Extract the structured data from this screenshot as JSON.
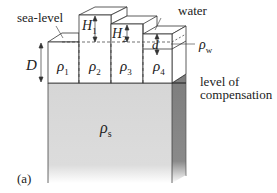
{
  "figure": {
    "panel_label": "(a)",
    "labels": {
      "sea_level": "sea-level",
      "water": "water",
      "rho_w": "ρ",
      "rho_w_sub": "w",
      "level_of_compensation_1": "level of",
      "level_of_compensation_2": "compensation",
      "D": "D",
      "H1": "H",
      "H1_sub": "1",
      "H2": "H",
      "H2_sub": "2",
      "d": "d",
      "rho1": "ρ",
      "rho1_sub": "1",
      "rho2": "ρ",
      "rho2_sub": "2",
      "rho3": "ρ",
      "rho3_sub": "3",
      "rho4": "ρ",
      "rho4_sub": "4",
      "rhos": "ρ",
      "rhos_sub": "s"
    },
    "colors": {
      "stroke": "#333333",
      "block_fill": "#ffffff",
      "substratum_fill": "#d9d9d9",
      "substratum_side": "#8a8a8a",
      "background": "#ffffff"
    }
  }
}
